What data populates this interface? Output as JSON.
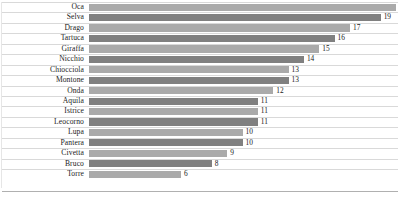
{
  "chart_data": {
    "type": "bar",
    "orientation": "horizontal",
    "title": "",
    "subtitle": "",
    "xlabel": "",
    "ylabel": "",
    "xlim": [
      0,
      20
    ],
    "grid": false,
    "legend": null,
    "categories": [
      "Oca",
      "Selva",
      "Drago",
      "Tartuca",
      "Giraffa",
      "Nicchio",
      "Chiocciola",
      "Montone",
      "Onda",
      "Aquila",
      "Istrice",
      "Leocorno",
      "Lupa",
      "Pantera",
      "Civetta",
      "Bruco",
      "Torre"
    ],
    "values": [
      20,
      19,
      17,
      16,
      15,
      14,
      13,
      13,
      12,
      11,
      11,
      11,
      10,
      10,
      9,
      8,
      6
    ],
    "data_labels": [
      "20",
      "19",
      "17",
      "16",
      "15",
      "14",
      "13",
      "13",
      "12",
      "11",
      "11",
      "11",
      "10",
      "10",
      "9",
      "8",
      "6"
    ],
    "bar_styles": [
      "light",
      "dark",
      "light",
      "dark",
      "light",
      "dark",
      "light",
      "dark",
      "light",
      "dark",
      "light",
      "dark",
      "light",
      "dark",
      "light",
      "dark",
      "light"
    ],
    "colors": {
      "bar_light": "#aaaaaa",
      "bar_dark": "#808080",
      "text": "#1a1a1a",
      "separator": "#d9d9d9",
      "axis": "#b0b0b0",
      "background": "#ffffff"
    }
  }
}
